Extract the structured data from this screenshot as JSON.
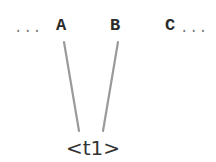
{
  "diagram": {
    "sequence": {
      "leading_ellipsis": "...",
      "trailing_ellipsis": "...",
      "tokens": [
        {
          "label": "A"
        },
        {
          "label": "B"
        },
        {
          "label": "C"
        }
      ]
    },
    "group_label": "<t1>",
    "edges": [
      {
        "from": "A",
        "to": "<t1>"
      },
      {
        "from": "B",
        "to": "<t1>"
      }
    ],
    "colors": {
      "edge": "#9a9a9a",
      "token_text": "#2a2a2a",
      "label_text": "#333333"
    }
  }
}
